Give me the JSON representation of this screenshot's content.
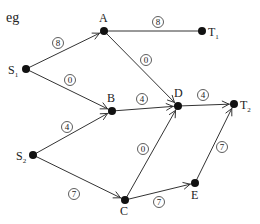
{
  "title": "eg",
  "nodes": [
    {
      "id": "S1",
      "label": "S",
      "sub": "1",
      "x": 26,
      "y": 69,
      "lx": 8,
      "ly": 74
    },
    {
      "id": "A",
      "label": "A",
      "sub": "",
      "x": 104,
      "y": 31,
      "lx": 99,
      "ly": 22
    },
    {
      "id": "T1",
      "label": "T",
      "sub": "1",
      "x": 202,
      "y": 31,
      "lx": 208,
      "ly": 36
    },
    {
      "id": "B",
      "label": "B",
      "sub": "",
      "x": 112,
      "y": 111,
      "lx": 107,
      "ly": 102
    },
    {
      "id": "D",
      "label": "D",
      "sub": "",
      "x": 178,
      "y": 106,
      "lx": 174,
      "ly": 97
    },
    {
      "id": "T2",
      "label": "T",
      "sub": "2",
      "x": 234,
      "y": 104,
      "lx": 240,
      "ly": 109
    },
    {
      "id": "S2",
      "label": "S",
      "sub": "2",
      "x": 33,
      "y": 155,
      "lx": 16,
      "ly": 160
    },
    {
      "id": "C",
      "label": "C",
      "sub": "",
      "x": 125,
      "y": 200,
      "lx": 120,
      "ly": 215
    },
    {
      "id": "E",
      "label": "E",
      "sub": "",
      "x": 195,
      "y": 183,
      "lx": 191,
      "ly": 199
    }
  ],
  "edges": [
    {
      "from": "S1",
      "to": "A",
      "weight": "8",
      "wx": 58,
      "wy": 43,
      "arrow": true
    },
    {
      "from": "S1",
      "to": "B",
      "weight": "0",
      "wx": 70,
      "wy": 80,
      "arrow": true
    },
    {
      "from": "A",
      "to": "T1",
      "weight": "8",
      "wx": 158,
      "wy": 22,
      "arrow": false
    },
    {
      "from": "A",
      "to": "D",
      "weight": "0",
      "wx": 146,
      "wy": 60,
      "arrow": true
    },
    {
      "from": "B",
      "to": "D",
      "weight": "4",
      "wx": 142,
      "wy": 99,
      "arrow": true
    },
    {
      "from": "D",
      "to": "T2",
      "weight": "4",
      "wx": 203,
      "wy": 95,
      "arrow": true
    },
    {
      "from": "S2",
      "to": "B",
      "weight": "4",
      "wx": 67,
      "wy": 127,
      "arrow": true
    },
    {
      "from": "S2",
      "to": "C",
      "weight": "7",
      "wx": 74,
      "wy": 194,
      "arrow": true
    },
    {
      "from": "C",
      "to": "D",
      "weight": "0",
      "wx": 143,
      "wy": 149,
      "arrow": true
    },
    {
      "from": "C",
      "to": "E",
      "weight": "7",
      "wx": 159,
      "wy": 202,
      "arrow": true
    },
    {
      "from": "E",
      "to": "T2",
      "weight": "7",
      "wx": 222,
      "wy": 147,
      "arrow": true
    }
  ],
  "colors": {
    "line": "#333333",
    "node": "#111111",
    "text": "#222222"
  }
}
